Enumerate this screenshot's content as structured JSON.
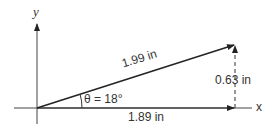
{
  "diagram": {
    "axis_x_label": "x",
    "axis_y_label": "y",
    "hypotenuse_label": "1.99 in",
    "vertical_label": "0.63 in",
    "horizontal_label": "1.89 in",
    "angle_label": "θ = 18°",
    "colors": {
      "line": "#222222",
      "text": "#333333"
    }
  }
}
